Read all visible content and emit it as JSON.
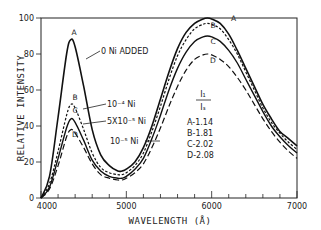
{
  "chart_data": {
    "type": "line",
    "title": "",
    "xlabel": "WAVELENGTH (Å)",
    "ylabel": "RELATIVE INTENSITY",
    "xlim": [
      4000,
      7000
    ],
    "ylim": [
      0,
      100
    ],
    "grid": false,
    "x_ticks": [
      "4000",
      "5000",
      "6000",
      "7000"
    ],
    "y_ticks": [
      "0",
      "20",
      "40",
      "60",
      "80",
      "100"
    ],
    "x": [
      4000,
      4100,
      4200,
      4300,
      4350,
      4400,
      4500,
      4600,
      4700,
      4800,
      4900,
      4950,
      5000,
      5100,
      5200,
      5300,
      5400,
      5500,
      5600,
      5700,
      5800,
      5900,
      5950,
      6000,
      6100,
      6200,
      6300,
      6400,
      6500,
      6600,
      6700,
      6800,
      6900,
      7000
    ],
    "series": [
      {
        "name": "A",
        "style": "solid",
        "values": [
          0,
          12,
          45,
          80,
          88,
          84,
          62,
          38,
          24,
          18,
          15,
          15,
          16,
          20,
          28,
          40,
          55,
          70,
          83,
          92,
          97,
          99.5,
          100,
          99.5,
          97,
          91,
          82,
          72,
          62,
          52,
          44,
          37,
          33,
          29
        ]
      },
      {
        "name": "B",
        "style": "short-dash",
        "values": [
          0,
          8,
          26,
          46,
          52,
          50,
          38,
          25,
          17,
          14,
          13,
          13,
          14,
          18,
          25,
          37,
          51,
          66,
          79,
          88,
          94,
          96.5,
          97,
          96.5,
          94,
          88,
          80,
          70,
          60,
          50,
          42,
          36,
          31,
          27
        ]
      },
      {
        "name": "C",
        "style": "solid",
        "values": [
          0,
          6,
          22,
          39,
          44,
          42,
          32,
          21,
          15,
          12,
          11,
          11,
          12,
          16,
          22,
          33,
          46,
          60,
          72,
          81,
          87,
          89.5,
          90,
          89.5,
          87,
          82,
          75,
          66,
          57,
          48,
          40,
          34,
          29,
          25
        ]
      },
      {
        "name": "D",
        "style": "long-dash",
        "values": [
          0,
          5,
          18,
          34,
          38,
          36,
          28,
          19,
          13,
          11,
          10,
          10,
          11,
          14,
          19,
          28,
          39,
          51,
          62,
          71,
          77,
          79.5,
          80,
          79.5,
          77,
          73,
          67,
          60,
          52,
          44,
          37,
          31,
          26,
          22
        ]
      }
    ],
    "annotations": [
      {
        "target": "A",
        "text": "0 Ni ADDED"
      },
      {
        "target": "B",
        "text": "10⁻⁴ Ni"
      },
      {
        "target": "C",
        "text": "5X10⁻⁵ Ni"
      },
      {
        "target": "D",
        "text": "10⁻⁵ Ni"
      }
    ],
    "legend": {
      "title_numerator": "I₁",
      "title_denominator": "Iₛ",
      "entries": [
        "A-1.14",
        "B-1.81",
        "C-2.02",
        "D-2.08"
      ],
      "position": "inside-center-right"
    }
  },
  "labels": {
    "curve_A": "A",
    "curve_B": "B",
    "curve_C": "C",
    "curve_D": "D",
    "legend_num": "I₁",
    "legend_den": "Iₛ"
  }
}
